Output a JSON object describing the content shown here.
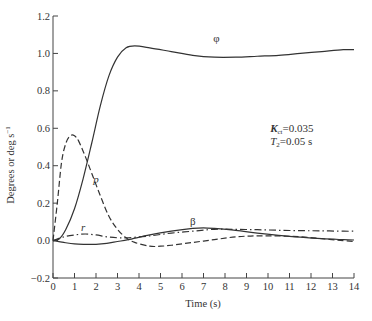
{
  "chart_data": {
    "type": "line",
    "title": "",
    "xlabel": "Time (s)",
    "ylabel": "Degrees or deg s⁻¹",
    "xlim": [
      0,
      14
    ],
    "ylim": [
      -0.2,
      1.2
    ],
    "xticks": [
      0,
      1,
      2,
      3,
      4,
      5,
      6,
      7,
      8,
      9,
      10,
      11,
      12,
      13,
      14
    ],
    "yticks": [
      -0.2,
      0.0,
      0.2,
      0.4,
      0.6,
      0.8,
      1.0,
      1.2
    ],
    "ytick_labels": [
      "−0.2",
      "0.0",
      "0.2",
      "0.4",
      "0.6",
      "0.8",
      "1.0",
      "1.2"
    ],
    "grid": false,
    "legend": "none (curves labeled inline)",
    "annotations": [
      {
        "text": "K",
        "sub": "ct",
        "rest": "=0.035",
        "x": 10.1,
        "y": 0.58
      },
      {
        "text": "T",
        "sub": "2",
        "rest": "=0.05 s",
        "x": 10.1,
        "y": 0.51
      }
    ],
    "series": [
      {
        "name": "φ",
        "style": "solid",
        "label_pos": {
          "x": 7.6,
          "y": 1.06
        },
        "x": [
          0,
          0.3,
          0.6,
          1.0,
          1.4,
          1.8,
          2.2,
          2.6,
          3.0,
          3.4,
          3.8,
          4.5,
          5.5,
          6.5,
          7.5,
          8.5,
          9.5,
          10.5,
          11.5,
          12.5,
          13.5,
          14
        ],
        "y": [
          0,
          0.01,
          0.06,
          0.17,
          0.33,
          0.52,
          0.72,
          0.88,
          0.98,
          1.03,
          1.04,
          1.03,
          1.01,
          0.99,
          0.98,
          0.98,
          0.985,
          0.99,
          1.0,
          1.01,
          1.02,
          1.02
        ]
      },
      {
        "name": "p",
        "style": "dashed",
        "label_pos": {
          "x": 2.0,
          "y": 0.31
        },
        "x": [
          0,
          0.2,
          0.4,
          0.6,
          0.8,
          1.0,
          1.2,
          1.5,
          1.8,
          2.2,
          2.6,
          3.0,
          3.4,
          3.8,
          4.5,
          5.0,
          5.5,
          6.5,
          7.5,
          8.5,
          9.5,
          10.5,
          11.5,
          12.5,
          13.5,
          14
        ],
        "y": [
          0,
          0.2,
          0.42,
          0.52,
          0.56,
          0.56,
          0.53,
          0.45,
          0.36,
          0.24,
          0.13,
          0.06,
          0.015,
          -0.01,
          -0.03,
          -0.03,
          -0.025,
          -0.01,
          0.005,
          0.02,
          0.025,
          0.025,
          0.02,
          0.01,
          0.0,
          -0.005
        ]
      },
      {
        "name": "r",
        "style": "dashdot",
        "label_pos": {
          "x": 1.4,
          "y": 0.05
        },
        "x": [
          0,
          0.5,
          1.0,
          1.5,
          2.0,
          2.5,
          3.0,
          3.5,
          4.5,
          5.5,
          6.5,
          7.5,
          8.5,
          9.5,
          10.5,
          11.5,
          12.5,
          13.5,
          14
        ],
        "y": [
          0,
          0.02,
          0.03,
          0.035,
          0.03,
          0.02,
          0.015,
          0.015,
          0.025,
          0.04,
          0.05,
          0.06,
          0.06,
          0.058,
          0.055,
          0.053,
          0.052,
          0.05,
          0.05
        ]
      },
      {
        "name": "β",
        "style": "solid",
        "label_pos": {
          "x": 6.5,
          "y": 0.085
        },
        "x": [
          0,
          0.5,
          1.0,
          1.5,
          2.0,
          2.5,
          3.0,
          3.5,
          4.5,
          5.5,
          6.5,
          7.0,
          7.5,
          8.5,
          9.5,
          10.5,
          11.5,
          12.5,
          13.5,
          14
        ],
        "y": [
          0,
          -0.01,
          -0.018,
          -0.02,
          -0.02,
          -0.015,
          -0.005,
          0.005,
          0.03,
          0.05,
          0.065,
          0.068,
          0.065,
          0.055,
          0.04,
          0.028,
          0.018,
          0.01,
          0.005,
          0.003
        ]
      }
    ]
  }
}
